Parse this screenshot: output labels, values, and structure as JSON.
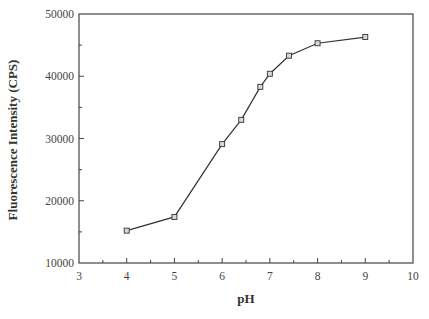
{
  "chart_data": {
    "type": "line",
    "title": "",
    "xlabel": "pH",
    "ylabel": "Fluorescence Intensity (CPS)",
    "xlim": [
      3,
      10
    ],
    "ylim": [
      10000,
      50000
    ],
    "x_ticks": [
      3,
      4,
      5,
      6,
      7,
      8,
      9,
      10
    ],
    "y_ticks": [
      10000,
      20000,
      30000,
      40000,
      50000
    ],
    "x_minor_step": 0.5,
    "y_minor_step": 5000,
    "grid": false,
    "legend": null,
    "series": [
      {
        "name": "Fluorescence Intensity",
        "marker": "square",
        "x": [
          4,
          5,
          6,
          6.4,
          6.8,
          7.0,
          7.4,
          8,
          9
        ],
        "values": [
          15200,
          17400,
          29100,
          33000,
          38300,
          40400,
          43300,
          45300,
          46300
        ]
      }
    ]
  },
  "colors": {
    "axis": "#444444",
    "line": "#333333",
    "marker_fill": "#d8d8d8",
    "marker_stroke": "#333333"
  }
}
